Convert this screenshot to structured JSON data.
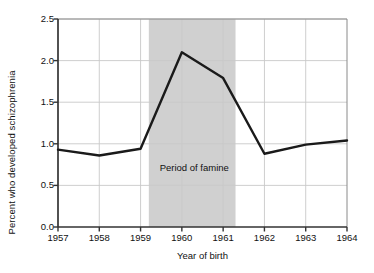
{
  "chart_data": {
    "type": "line",
    "title": "",
    "xlabel": "Year of birth",
    "ylabel": "Percent who developed schizophrenia",
    "x": [
      1957,
      1958,
      1959,
      1960,
      1961,
      1962,
      1963,
      1964
    ],
    "categories": [
      "1957",
      "1958",
      "1959",
      "1960",
      "1961",
      "1962",
      "1963",
      "1964"
    ],
    "values": [
      0.93,
      0.86,
      0.94,
      2.1,
      1.79,
      0.88,
      0.99,
      1.04
    ],
    "series": [
      {
        "name": "Percent who developed schizophrenia",
        "values": [
          0.93,
          0.86,
          0.94,
          2.1,
          1.79,
          0.88,
          0.99,
          1.04
        ]
      }
    ],
    "xlim": [
      1957,
      1964
    ],
    "ylim": [
      0.0,
      2.5
    ],
    "ytick_labels": [
      "0.0",
      "0.5",
      "1.0",
      "1.5",
      "2.0",
      "2.5"
    ],
    "ytick_values": [
      0.0,
      0.5,
      1.0,
      1.5,
      2.0,
      2.5
    ],
    "xtick_labels": [
      "1957",
      "1958",
      "1959",
      "1960",
      "1961",
      "1962",
      "1963",
      "1964"
    ],
    "xtick_values": [
      1957,
      1958,
      1959,
      1960,
      1961,
      1962,
      1963,
      1964
    ],
    "grid": true,
    "legend": "none",
    "annotations": [
      {
        "text": "Period of famine",
        "x": 1960.3,
        "y": 0.72,
        "type": "shaded-band-label"
      }
    ],
    "shaded_bands": [
      {
        "label": "Period of famine",
        "x_start": 1959.2,
        "x_end": 1961.3,
        "color": "#d0d0d0"
      }
    ],
    "colors": {
      "line": "#1a1a1a",
      "grid": "#c8c8c8",
      "axis": "#333333",
      "band": "#d0d0d0",
      "background": "#ffffff",
      "text": "#111111"
    },
    "line_width": 2.4
  }
}
